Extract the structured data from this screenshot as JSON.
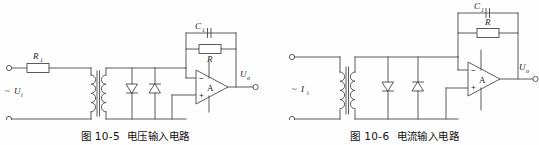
{
  "sheet": {
    "title": "电压输入电路 / 电流输入电路原理图",
    "line_color": "#4a4a4a",
    "background_color": "#fefefe",
    "text_color": "#1a1a1a"
  },
  "figures": [
    {
      "id": "fig-10-5",
      "caption_number": "图 10-5",
      "caption_text": "电压输入电路",
      "source": {
        "label": "U",
        "subscript": "i",
        "prefix": "~",
        "full": "~Ui",
        "kind": "voltage-source"
      },
      "series_element": {
        "label": "R",
        "subscript": "1",
        "full": "R1",
        "kind": "resistor"
      },
      "transformer": {
        "label": "",
        "kind": "iron-core-transformer"
      },
      "diodes": [
        {
          "name": "diode-left",
          "orientation": "down"
        },
        {
          "name": "diode-right",
          "orientation": "up"
        }
      ],
      "opamp": {
        "label": "A",
        "inverting_sign": "−",
        "noninverting_sign": "+"
      },
      "feedback": [
        {
          "label": "C",
          "subscript": "1",
          "full": "C1",
          "kind": "capacitor"
        },
        {
          "label": "R",
          "subscript": "",
          "full": "R",
          "kind": "resistor"
        }
      ],
      "output": {
        "label": "U",
        "subscript": "o",
        "full": "Uo"
      }
    },
    {
      "id": "fig-10-6",
      "caption_number": "图 10-6",
      "caption_text": "电流输入电路",
      "source": {
        "label": "I",
        "subscript": "i",
        "prefix": "~",
        "full": "~Ii",
        "kind": "current-source"
      },
      "series_element": null,
      "transformer": {
        "label": "",
        "kind": "iron-core-transformer"
      },
      "diodes": [
        {
          "name": "diode-left",
          "orientation": "down"
        },
        {
          "name": "diode-right",
          "orientation": "up"
        }
      ],
      "opamp": {
        "label": "A",
        "inverting_sign": "−",
        "noninverting_sign": "+"
      },
      "feedback": [
        {
          "label": "C",
          "subscript": "1",
          "full": "C1",
          "kind": "capacitor"
        },
        {
          "label": "R",
          "subscript": "",
          "full": "R",
          "kind": "resistor"
        }
      ],
      "output": {
        "label": "U",
        "subscript": "o",
        "full": "Uo"
      }
    }
  ]
}
